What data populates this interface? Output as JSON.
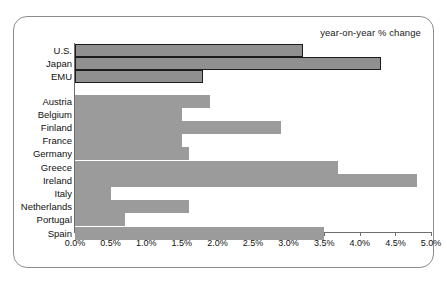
{
  "chart_data": {
    "type": "bar",
    "orientation": "horizontal",
    "title": "",
    "subtitle": "",
    "annotation": "year-on-year % change",
    "xlabel": "",
    "ylabel": "",
    "xlim": [
      0,
      5
    ],
    "grid": false,
    "legend_position": "top-right",
    "tick_labels": [
      "0.0%",
      "0.5%",
      "1.0%",
      "1.5%",
      "2.0%",
      "2.5%",
      "3.0%",
      "3.5%",
      "4.0%",
      "4.5%",
      "5.0%"
    ],
    "tick_values": [
      0.0,
      0.5,
      1.0,
      1.5,
      2.0,
      2.5,
      3.0,
      3.5,
      4.0,
      4.5,
      5.0
    ],
    "categories": [
      "U.S.",
      "Japan",
      "EMU",
      "Austria",
      "Belgium",
      "Finland",
      "France",
      "Germany",
      "Greece",
      "Ireland",
      "Italy",
      "Netherlands",
      "Portugal",
      "Spain"
    ],
    "values": [
      3.2,
      4.3,
      1.8,
      1.9,
      1.5,
      2.9,
      1.5,
      1.6,
      3.7,
      4.8,
      0.5,
      1.6,
      0.7,
      3.5
    ],
    "bars": [
      {
        "label": "U.S.",
        "value": 3.2,
        "highlight": true,
        "gap_after": false
      },
      {
        "label": "Japan",
        "value": 4.3,
        "highlight": true,
        "gap_after": false
      },
      {
        "label": "EMU",
        "value": 1.8,
        "highlight": true,
        "gap_after": true
      },
      {
        "label": "Austria",
        "value": 1.9,
        "highlight": false,
        "gap_after": false
      },
      {
        "label": "Belgium",
        "value": 1.5,
        "highlight": false,
        "gap_after": false
      },
      {
        "label": "Finland",
        "value": 2.9,
        "highlight": false,
        "gap_after": false
      },
      {
        "label": "France",
        "value": 1.5,
        "highlight": false,
        "gap_after": false
      },
      {
        "label": "Germany",
        "value": 1.6,
        "highlight": false,
        "gap_after": false
      },
      {
        "label": "Greece",
        "value": 3.7,
        "highlight": false,
        "gap_after": false
      },
      {
        "label": "Ireland",
        "value": 4.8,
        "highlight": false,
        "gap_after": false
      },
      {
        "label": "Italy",
        "value": 0.5,
        "highlight": false,
        "gap_after": false
      },
      {
        "label": "Netherlands",
        "value": 1.6,
        "highlight": false,
        "gap_after": false
      },
      {
        "label": "Portugal",
        "value": 0.7,
        "highlight": false,
        "gap_after": false
      },
      {
        "label": "Spain",
        "value": 3.5,
        "highlight": false,
        "gap_after": false
      }
    ],
    "colors": {
      "bar_fill": "#9b9b9b",
      "highlight_fill": "#909090",
      "highlight_border": "#1c1c1c",
      "axis": "#6e6e6e",
      "frame": "#8c8c8c",
      "background": "#ffffff",
      "text": "#111111"
    }
  }
}
